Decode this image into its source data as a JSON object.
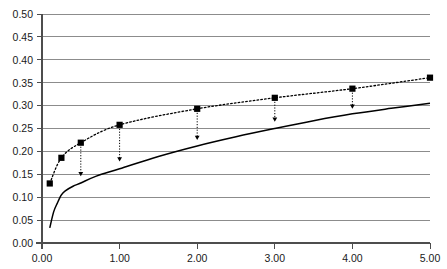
{
  "chart_data": {
    "type": "line",
    "title": "",
    "subtitle": "",
    "xlabel": "",
    "ylabel": "",
    "xlim": [
      0.0,
      5.0
    ],
    "ylim": [
      0.0,
      0.5
    ],
    "grid": "horizontal",
    "legend": "none",
    "xticks": [
      0.0,
      1.0,
      2.0,
      3.0,
      4.0,
      5.0
    ],
    "xticklabels": [
      "0.00",
      "1.00",
      "2.00",
      "3.00",
      "4.00",
      "5.00"
    ],
    "yticks": [
      0.0,
      0.05,
      0.1,
      0.15,
      0.2,
      0.25,
      0.3,
      0.35,
      0.4,
      0.45,
      0.5
    ],
    "yticklabels": [
      "0.00",
      "0.05",
      "0.10",
      "0.15",
      "0.20",
      "0.25",
      "0.30",
      "0.35",
      "0.40",
      "0.45",
      "0.50"
    ],
    "series": [
      {
        "name": "upper-dotted-series",
        "style": "dotted-with-square-markers",
        "color": "#000000",
        "x": [
          0.1,
          0.25,
          0.5,
          1.0,
          2.0,
          3.0,
          4.0,
          5.0
        ],
        "values": [
          0.13,
          0.186,
          0.219,
          0.258,
          0.293,
          0.317,
          0.337,
          0.361
        ]
      },
      {
        "name": "lower-solid-curve",
        "style": "solid",
        "color": "#000000",
        "x": [
          0.1,
          0.15,
          0.2,
          0.25,
          0.3,
          0.4,
          0.5,
          0.7,
          1.0,
          1.5,
          2.0,
          2.5,
          3.0,
          3.5,
          4.0,
          4.5,
          5.0
        ],
        "values": [
          0.033,
          0.068,
          0.088,
          0.105,
          0.114,
          0.124,
          0.131,
          0.146,
          0.162,
          0.189,
          0.212,
          0.232,
          0.25,
          0.267,
          0.282,
          0.294,
          0.305
        ]
      }
    ],
    "annotations": {
      "name": "vertical-gap-arrows",
      "description": "downward dotted arrows from upper dotted series to lower solid curve",
      "items": [
        {
          "x": 0.5,
          "y_from": 0.219,
          "y_to": 0.146
        },
        {
          "x": 1.0,
          "y_from": 0.258,
          "y_to": 0.178
        },
        {
          "x": 2.0,
          "y_from": 0.293,
          "y_to": 0.225
        },
        {
          "x": 3.0,
          "y_from": 0.317,
          "y_to": 0.265
        },
        {
          "x": 4.0,
          "y_from": 0.337,
          "y_to": 0.293
        }
      ]
    },
    "colors": {
      "ink": "#000000",
      "gridline": "#808080",
      "axis": "#4d4d4d",
      "background": "#ffffff"
    }
  }
}
